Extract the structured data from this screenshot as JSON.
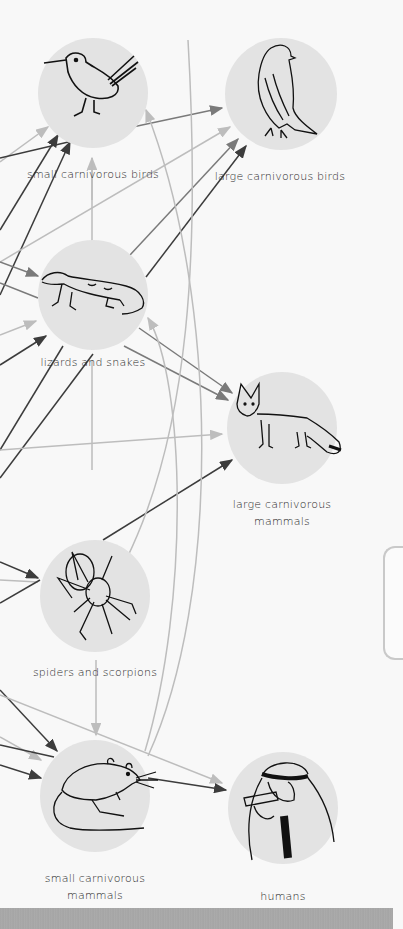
{
  "diagram": {
    "colors": {
      "background": "#f8f8f8",
      "node_fill": "#e3e3e3",
      "arrow_dark": "#3c3c3c",
      "arrow_mid": "#7a7a7a",
      "arrow_light": "#bdbdbd",
      "label": "#2a2a2a"
    },
    "nodes": [
      {
        "id": "small-carnivorous-birds",
        "label": "small carnivorous birds",
        "icon": "roadrunner-bird-icon"
      },
      {
        "id": "large-carnivorous-birds",
        "label": "large carnivorous birds",
        "icon": "falcon-icon"
      },
      {
        "id": "lizards-and-snakes",
        "label": "lizards and snakes",
        "icon": "lizard-icon"
      },
      {
        "id": "large-carnivorous-mammals",
        "label": "large carnivorous\nmammals",
        "icon": "fox-icon"
      },
      {
        "id": "spiders-and-scorpions",
        "label": "spiders and scorpions",
        "icon": "spider-icon"
      },
      {
        "id": "small-carnivorous-mammals",
        "label": "small carnivorous\nmammals",
        "icon": "jerboa-rodent-icon"
      },
      {
        "id": "humans",
        "label": "humans",
        "icon": "human-eating-icon"
      }
    ],
    "edges": [
      {
        "from": "small-carnivorous-birds",
        "to": "large-carnivorous-birds"
      },
      {
        "from": "lizards-and-snakes",
        "to": "large-carnivorous-birds"
      },
      {
        "from": "lizards-and-snakes",
        "to": "large-carnivorous-mammals"
      },
      {
        "from": "lizards-and-snakes",
        "to": "small-carnivorous-birds"
      },
      {
        "from": "spiders-and-scorpions",
        "to": "large-carnivorous-mammals"
      },
      {
        "from": "spiders-and-scorpions",
        "to": "lizards-and-snakes"
      },
      {
        "from": "spiders-and-scorpions",
        "to": "small-carnivorous-mammals"
      },
      {
        "from": "small-carnivorous-mammals",
        "to": "humans"
      },
      {
        "from": "small-carnivorous-mammals",
        "to": "small-carnivorous-birds"
      },
      {
        "from": "small-carnivorous-mammals",
        "to": "lizards-and-snakes"
      }
    ]
  },
  "side_panel": {
    "state": "collapsed"
  }
}
